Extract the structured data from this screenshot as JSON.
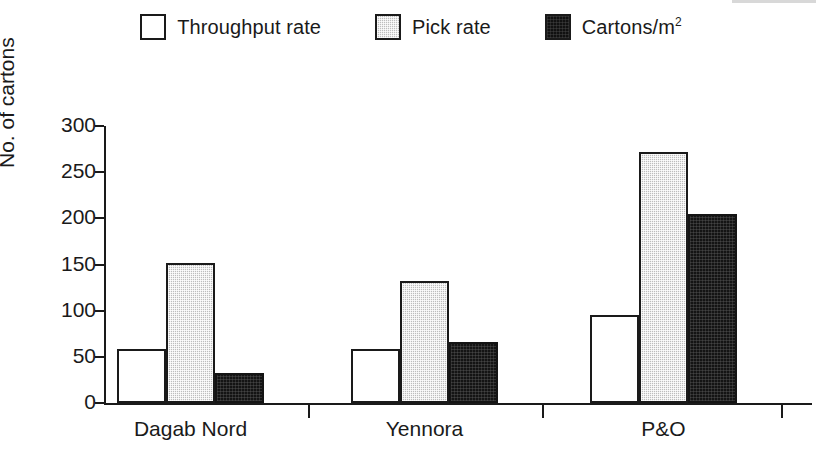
{
  "chart_data": {
    "type": "bar",
    "title": "",
    "subtitle": "",
    "xlabel": "",
    "ylabel": "No. of cartons",
    "ylim": [
      0,
      300
    ],
    "yticks": [
      0,
      50,
      100,
      150,
      200,
      250,
      300
    ],
    "grid": false,
    "legend_position": "top-center",
    "categories": [
      "Dagab Nord",
      "Yennora",
      "P&O"
    ],
    "series": [
      {
        "name": "Throughput rate",
        "color": "#ffffff",
        "values": [
          58,
          58,
          95
        ]
      },
      {
        "name": "Pick rate",
        "color": "#bdbdbd",
        "values": [
          152,
          132,
          272
        ]
      },
      {
        "name": "Cartons/m2",
        "color": "#141414",
        "values": [
          32,
          66,
          205
        ]
      }
    ]
  },
  "legend": {
    "items": [
      {
        "label": "Throughput rate",
        "swatch": "white-square-icon"
      },
      {
        "label": "Pick rate",
        "swatch": "gray-square-icon"
      },
      {
        "label_main": "Cartons/m",
        "label_sup": "2",
        "swatch": "black-square-icon"
      }
    ]
  },
  "axes": {
    "y_title": "No. of cartons",
    "y_tick_labels": [
      "300",
      "250",
      "200",
      "150",
      "100",
      "50",
      "0"
    ],
    "x_tick_labels": [
      "Dagab Nord",
      "Yennora",
      "P&O"
    ]
  }
}
